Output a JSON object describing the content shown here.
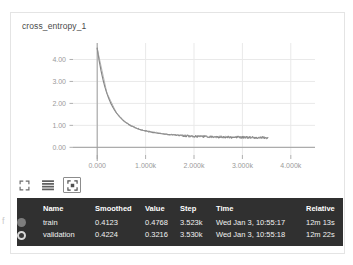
{
  "artifact_text": "f",
  "panel": {
    "title": "cross_entropy_1"
  },
  "toolbar": {
    "items": [
      {
        "icon": "expand-corners-icon",
        "label": "Fit domain to data"
      },
      {
        "icon": "data-table-icon",
        "label": "Toggle data table"
      },
      {
        "icon": "fit-to-screen-icon",
        "label": "Expand chart"
      }
    ]
  },
  "legend": {
    "columns": [
      "Name",
      "Smoothed",
      "Value",
      "Step",
      "Time",
      "Relative"
    ],
    "rows": [
      {
        "swatch": "filled",
        "color": "#7d7d7d",
        "name": "train",
        "smoothed": "0.4123",
        "value": "0.4768",
        "step": "3.523k",
        "time": "Wed Jan 3, 10:55:17",
        "relative": "12m 13s"
      },
      {
        "swatch": "hollow",
        "color": "#d8d8d8",
        "name": "validation",
        "smoothed": "0.4224",
        "value": "0.3216",
        "step": "3.530k",
        "time": "Wed Jan 3, 10:55:18",
        "relative": "12m 22s"
      }
    ]
  },
  "chart_data": {
    "type": "line",
    "title": "cross_entropy_1",
    "xlabel": "",
    "ylabel": "",
    "xlim": [
      -500,
      4500
    ],
    "ylim": [
      -0.35,
      4.75
    ],
    "grid": true,
    "legend_position": "below-chart",
    "xticks": [
      0,
      1000,
      2000,
      3000,
      4000
    ],
    "xticklabels": [
      "0.000",
      "1.000k",
      "2.000k",
      "3.000k",
      "4.000k"
    ],
    "yticks": [
      0,
      1,
      2,
      3,
      4
    ],
    "yticklabels": [
      "0.00",
      "1.00",
      "2.00",
      "3.00",
      "4.00"
    ],
    "series": [
      {
        "name": "train",
        "color": "#7d7d7d",
        "x": [
          0,
          40,
          80,
          120,
          160,
          200,
          240,
          280,
          320,
          360,
          400,
          440,
          480,
          520,
          560,
          600,
          640,
          680,
          720,
          760,
          800,
          840,
          880,
          920,
          960,
          1000,
          1060,
          1120,
          1180,
          1240,
          1300,
          1360,
          1420,
          1480,
          1540,
          1600,
          1680,
          1760,
          1840,
          1920,
          2000,
          2080,
          2160,
          2240,
          2320,
          2400,
          2480,
          2560,
          2640,
          2720,
          2800,
          2880,
          2960,
          3040,
          3120,
          3200,
          3280,
          3360,
          3440,
          3523
        ],
        "y": [
          4.52,
          3.95,
          3.48,
          3.08,
          2.74,
          2.46,
          2.22,
          2.01,
          1.84,
          1.69,
          1.56,
          1.45,
          1.35,
          1.26,
          1.18,
          1.12,
          1.06,
          1.0,
          0.96,
          0.92,
          0.88,
          0.85,
          0.82,
          0.79,
          0.77,
          0.75,
          0.72,
          0.69,
          0.67,
          0.65,
          0.63,
          0.61,
          0.6,
          0.58,
          0.57,
          0.56,
          0.54,
          0.53,
          0.52,
          0.51,
          0.5,
          0.5,
          0.49,
          0.49,
          0.48,
          0.48,
          0.47,
          0.47,
          0.47,
          0.46,
          0.46,
          0.46,
          0.45,
          0.45,
          0.45,
          0.45,
          0.44,
          0.44,
          0.44,
          0.44
        ]
      },
      {
        "name": "validation",
        "color": "#9a9a9a",
        "x": [
          0,
          200,
          400,
          600,
          800,
          1000,
          1200,
          1400,
          1600,
          1800,
          2000,
          2200,
          2400,
          2600,
          2800,
          3000,
          3200,
          3400,
          3530
        ],
        "y": [
          4.5,
          2.48,
          1.55,
          1.11,
          0.87,
          0.74,
          0.68,
          0.6,
          0.56,
          0.53,
          0.5,
          0.49,
          0.48,
          0.47,
          0.46,
          0.45,
          0.45,
          0.44,
          0.43
        ]
      }
    ],
    "annotations": {
      "noise_band_start_x": 1300,
      "noise_amplitude": 0.045
    }
  },
  "colors": {
    "tooltip_bg": "#303030",
    "card_border": "#e4e4e4",
    "grid": "#e9e9e9",
    "axis": "#9e9e9e",
    "tick_text": "#9a9a9a",
    "title_text": "#4a4a4a"
  }
}
